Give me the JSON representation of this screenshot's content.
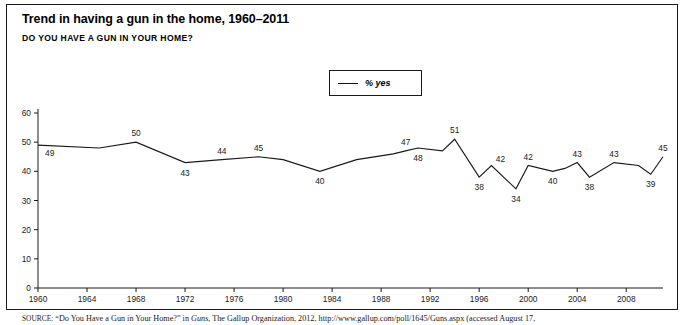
{
  "figure": {
    "title": "Trend in having a gun in the home, 1960–2011",
    "subtitle": "DO YOU HAVE A GUN IN YOUR HOME?",
    "source_prefix": "SOURCE:",
    "source_part1": " “Do You Have a Gun in Your Home?” in ",
    "source_italic": "Guns",
    "source_part2": ", The Gallup Organization, 2012, http://www.gallup.com/poll/1645/Guns.aspx (accessed August 17,"
  },
  "legend": {
    "position": "top-center",
    "entries": [
      {
        "label": "% yes",
        "color": "#1a1a1a",
        "marker": "line"
      }
    ]
  },
  "chart_data": {
    "type": "line",
    "title": "Trend in having a gun in the home, 1960–2011",
    "subtitle": "DO YOU HAVE A GUN IN YOUR HOME?",
    "xlabel": "",
    "ylabel": "",
    "xlim": [
      1960,
      2011
    ],
    "ylim": [
      0,
      60
    ],
    "ytick_step": 10,
    "yticks": [
      0,
      10,
      20,
      30,
      40,
      50,
      60
    ],
    "xticks": [
      1960,
      1964,
      1968,
      1972,
      1976,
      1980,
      1984,
      1988,
      1992,
      1996,
      2000,
      2004,
      2008
    ],
    "grid": false,
    "series": [
      {
        "name": "% yes",
        "color": "#1a1a1a",
        "x": [
          1960,
          1965,
          1968,
          1972,
          1975,
          1978,
          1980,
          1983,
          1986,
          1989,
          1990,
          1991,
          1993,
          1994,
          1996,
          1997,
          1999,
          2000,
          2002,
          2003,
          2004,
          2005,
          2007,
          2009,
          2010,
          2011
        ],
        "values": [
          49,
          48,
          50,
          43,
          44,
          45,
          44,
          40,
          44,
          46,
          47,
          48,
          47,
          51,
          38,
          42,
          34,
          42,
          40,
          41,
          43,
          38,
          43,
          42,
          39,
          45
        ]
      }
    ],
    "point_labels": [
      {
        "year": 1960,
        "value": 49,
        "text": "49",
        "pos": "below-right"
      },
      {
        "year": 1968,
        "value": 50,
        "text": "50",
        "pos": "above"
      },
      {
        "year": 1972,
        "value": 43,
        "text": "43",
        "pos": "below"
      },
      {
        "year": 1975,
        "value": 44,
        "text": "44",
        "pos": "above"
      },
      {
        "year": 1978,
        "value": 45,
        "text": "45",
        "pos": "above"
      },
      {
        "year": 1983,
        "value": 40,
        "text": "40",
        "pos": "below"
      },
      {
        "year": 1990,
        "value": 47,
        "text": "47",
        "pos": "above"
      },
      {
        "year": 1991,
        "value": 48,
        "text": "48",
        "pos": "below"
      },
      {
        "year": 1994,
        "value": 51,
        "text": "51",
        "pos": "above"
      },
      {
        "year": 1996,
        "value": 38,
        "text": "38",
        "pos": "below"
      },
      {
        "year": 1997,
        "value": 42,
        "text": "42",
        "pos": "above-right"
      },
      {
        "year": 1999,
        "value": 34,
        "text": "34",
        "pos": "below"
      },
      {
        "year": 2000,
        "value": 42,
        "text": "42",
        "pos": "above"
      },
      {
        "year": 2002,
        "value": 40,
        "text": "40",
        "pos": "below"
      },
      {
        "year": 2004,
        "value": 43,
        "text": "43",
        "pos": "above"
      },
      {
        "year": 2005,
        "value": 38,
        "text": "38",
        "pos": "below"
      },
      {
        "year": 2007,
        "value": 43,
        "text": "43",
        "pos": "above"
      },
      {
        "year": 2010,
        "value": 39,
        "text": "39",
        "pos": "below"
      },
      {
        "year": 2011,
        "value": 45,
        "text": "45",
        "pos": "above"
      }
    ]
  }
}
